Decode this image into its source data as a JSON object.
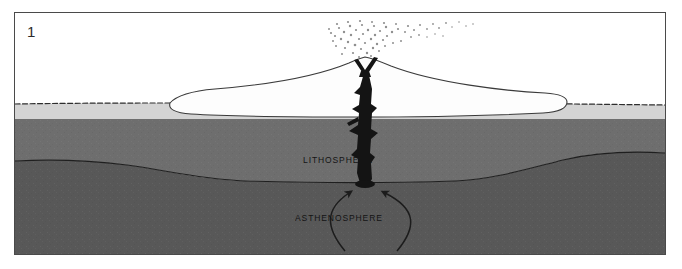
{
  "figure": {
    "panel_number": "1",
    "caption_visible": false
  },
  "frame": {
    "border_color": "#4a4a4a",
    "background_color": "#ffffff"
  },
  "layers": [
    {
      "id": "sky",
      "label": "",
      "color": "#ffffff",
      "description": "white sky / air above ground surface"
    },
    {
      "id": "crust",
      "label": "",
      "color": "#d4d4d4",
      "description": "thin light grey crust band beneath the stippled ground surface line"
    },
    {
      "id": "lithosphere",
      "label": "LITHOSPHERE",
      "color": "#6e6e6e",
      "label_x": 288,
      "label_y": 150,
      "description": "medium grey rigid outer layer"
    },
    {
      "id": "asthenosphere",
      "label": "ASTHENOSPHERE",
      "color": "#585858",
      "label_x": 280,
      "label_y": 208,
      "description": "darker grey ductile layer below the lithosphere"
    }
  ],
  "features": {
    "ice_sheet": {
      "name": "ice-sheet",
      "color": "#fdfdfd",
      "outline_color": "#3a3a3a",
      "description": "large white lens-shaped ice sheet / glacier resting on the ground surface"
    },
    "volcano": {
      "name": "volcano",
      "vent_color": "#141414",
      "description": "Y-shaped erupting vent at the summit of a low cone near the centre"
    },
    "magma_conduit": {
      "name": "magma-conduit",
      "color": "#141414",
      "description": "irregular branching black magma conduit rising from the asthenosphere through the lithosphere to the vent"
    },
    "ash_plume": {
      "name": "ash-plume",
      "color": "#8c8c8c",
      "description": "stippled billowing ash and steam plume drifting to the right"
    },
    "convection_arrows": {
      "name": "convection-arrows",
      "color": "#1c1c1c",
      "count": 2,
      "description": "two curved arrows in the asthenosphere converging upward toward the base of the conduit"
    },
    "ground_surface": {
      "name": "ground-surface-line",
      "color": "#2e2e2e",
      "description": "dark stippled line marking the land surface"
    }
  }
}
